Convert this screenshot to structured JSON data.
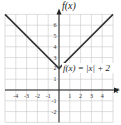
{
  "chart_data": {
    "type": "line",
    "title": "",
    "xlabel": "x",
    "ylabel": "f(x)",
    "xlim": [
      -5,
      5
    ],
    "ylim": [
      -3,
      7
    ],
    "grid": true,
    "x_ticks": [
      "-4",
      "-3",
      "-2",
      "-1",
      "1",
      "2",
      "3",
      "4"
    ],
    "y_ticks": [
      "6",
      "5",
      "4",
      "3",
      "2",
      "1",
      "-1",
      "-2"
    ],
    "annotation": "f(x) = |x| + 2",
    "series": [
      {
        "name": "f(x) = |x| + 2",
        "x": [
          -5,
          0,
          5
        ],
        "y": [
          7,
          2,
          7
        ]
      }
    ],
    "colors": {
      "line": "#333333",
      "grid": "#c8c8c8",
      "axis": "#222222"
    }
  }
}
